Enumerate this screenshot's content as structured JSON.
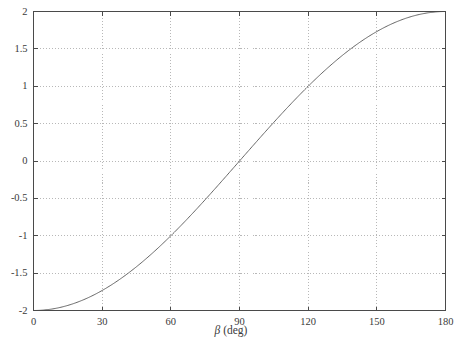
{
  "chart_data": {
    "type": "line",
    "title": "",
    "xlabel": "β (deg)",
    "ylabel": "",
    "xlim": [
      0,
      180
    ],
    "ylim": [
      -2,
      2
    ],
    "grid": true,
    "grid_style": "dotted",
    "legend": "none",
    "line_color": "#555555",
    "xticks": [
      0,
      30,
      60,
      90,
      120,
      150,
      180
    ],
    "xtick_labels": [
      "0",
      "30",
      "60",
      "90",
      "120",
      "150",
      "180"
    ],
    "yticks": [
      -2,
      -1.5,
      -1,
      -0.5,
      0,
      0.5,
      1,
      1.5,
      2
    ],
    "ytick_labels": [
      "-2",
      "-1.5",
      "-1",
      "-0.5",
      "0",
      "0.5",
      "1",
      "1.5",
      "2"
    ],
    "series": [
      {
        "name": "curve",
        "expression": "-2*cos(beta)",
        "x": [
          0,
          5,
          10,
          15,
          20,
          25,
          30,
          35,
          40,
          45,
          50,
          55,
          60,
          65,
          70,
          75,
          80,
          85,
          90,
          95,
          100,
          105,
          110,
          115,
          120,
          125,
          130,
          135,
          140,
          145,
          150,
          155,
          160,
          165,
          170,
          175,
          180
        ],
        "values": [
          -2.0,
          -1.992,
          -1.97,
          -1.932,
          -1.879,
          -1.813,
          -1.732,
          -1.638,
          -1.532,
          -1.414,
          -1.286,
          -1.147,
          -1.0,
          -0.845,
          -0.684,
          -0.518,
          -0.347,
          -0.174,
          0.0,
          0.174,
          0.347,
          0.518,
          0.684,
          0.845,
          1.0,
          1.147,
          1.286,
          1.414,
          1.532,
          1.638,
          1.732,
          1.813,
          1.879,
          1.932,
          1.97,
          1.992,
          2.0
        ]
      }
    ]
  },
  "axis": {
    "x_title_symbol": "β",
    "x_title_unit": " (deg)"
  }
}
